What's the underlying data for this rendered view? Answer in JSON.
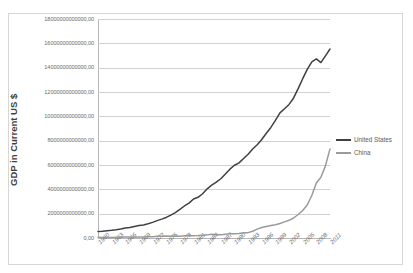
{
  "chart_data": {
    "type": "line",
    "title": "2012",
    "xlabel": "",
    "ylabel": "GDP in Current US $",
    "ylim": [
      0,
      18000000000000
    ],
    "xlim": [
      1960,
      2011
    ],
    "grid": true,
    "legend_position": "right",
    "ytick_labels": [
      "18000000000000,00",
      "16000000000000,00",
      "14000000000000,00",
      "12000000000000,00",
      "10000000000000,00",
      "8000000000000,00",
      "6000000000000,00",
      "4000000000000,00",
      "2000000000000,00",
      "0,00"
    ],
    "ytick_values": [
      18000000000000,
      16000000000000,
      14000000000000,
      12000000000000,
      10000000000000,
      8000000000000,
      6000000000000,
      4000000000000,
      2000000000000,
      0
    ],
    "xtick_labels": [
      "1960",
      "1963",
      "1966",
      "1969",
      "1972",
      "1975",
      "1978",
      "1981",
      "1984",
      "1987",
      "1990",
      "1993",
      "1996",
      "1999",
      "2002",
      "2005",
      "2008",
      "2011"
    ],
    "x": [
      1960,
      1961,
      1962,
      1963,
      1964,
      1965,
      1966,
      1967,
      1968,
      1969,
      1970,
      1971,
      1972,
      1973,
      1974,
      1975,
      1976,
      1977,
      1978,
      1979,
      1980,
      1981,
      1982,
      1983,
      1984,
      1985,
      1986,
      1987,
      1988,
      1989,
      1990,
      1991,
      1992,
      1993,
      1994,
      1995,
      1996,
      1997,
      1998,
      1999,
      2000,
      2001,
      2002,
      2003,
      2004,
      2005,
      2006,
      2007,
      2008,
      2009,
      2010,
      2011
    ],
    "series": [
      {
        "name": "United States",
        "color": "#404040",
        "values": [
          543300000000,
          563300000000,
          605100000000,
          638600000000,
          685800000000,
          743700000000,
          815000000000,
          861700000000,
          942500000000,
          1019900000000,
          1075884000000,
          1167770000000,
          1282449000000,
          1428549000000,
          1548825000000,
          1688923000000,
          1877587000000,
          2085951000000,
          2356571000000,
          2632143000000,
          2862505000000,
          3210956000000,
          3344991000000,
          3638137000000,
          4040693000000,
          4346734000000,
          4590155000000,
          4870217000000,
          5252629000000,
          5657693000000,
          5979589000000,
          6174043000000,
          6539299000000,
          6878718000000,
          7308755000000,
          7664060000000,
          8100201000000,
          8608515000000,
          9089168000000,
          9660624000000,
          10284779000000,
          10621824000000,
          10977514000000,
          11510670000000,
          12274928000000,
          13093726000000,
          13855888000000,
          14477635000000,
          14718582000000,
          14418739000000,
          14964372000000,
          15533825000000
        ]
      },
      {
        "name": "China",
        "color": "#9a9a9a",
        "values": [
          59716000000,
          50056000000,
          47209000000,
          50707000000,
          59708000000,
          70436000000,
          76720000000,
          72882000000,
          70846000000,
          79706000000,
          91506000000,
          98562000000,
          112160000000,
          136770000000,
          142250000000,
          161160000000,
          151630000000,
          172350000000,
          148180000000,
          178280000000,
          189400000000,
          194110000000,
          203180000000,
          228460000000,
          257430000000,
          306670000000,
          297830000000,
          270370000000,
          309520000000,
          343970000000,
          356940000000,
          379470000000,
          422660000000,
          440500000000,
          559220000000,
          728010000000,
          856080000000,
          952650000000,
          1019480000000,
          1083280000000,
          1198480000000,
          1324810000000,
          1453830000000,
          1640960000000,
          1931640000000,
          2256900000000,
          2712950000000,
          3494230000000,
          4521830000000,
          4990230000000,
          5930500000000,
          7321990000000
        ]
      }
    ]
  },
  "legend": {
    "items": [
      {
        "label": "United States",
        "color": "#404040"
      },
      {
        "label": "China",
        "color": "#9a9a9a"
      }
    ]
  }
}
